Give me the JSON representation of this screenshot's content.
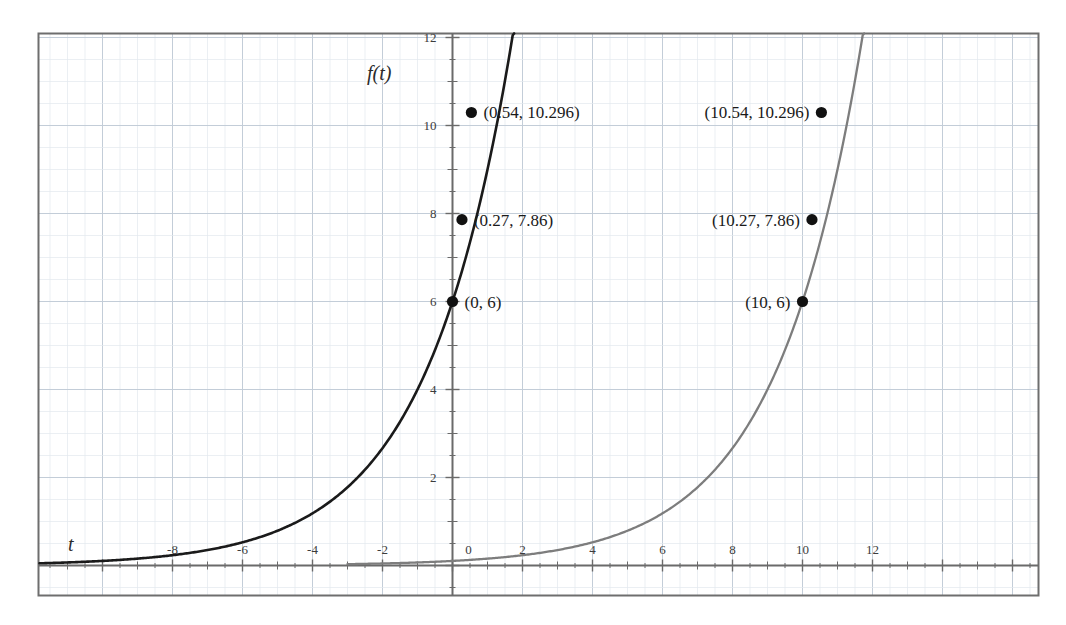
{
  "page": {
    "partial_heading": "Is once a.."
  },
  "chart_data": {
    "type": "line",
    "title": "",
    "xlabel": "t",
    "ylabel": "f(t)",
    "xlim": [
      -9.8,
      13.8
    ],
    "ylim": [
      -0.9,
      12.6
    ],
    "grid": true,
    "legend": false,
    "x_ticks": [
      -8,
      -6,
      -4,
      -2,
      0,
      2,
      4,
      6,
      8,
      10,
      12
    ],
    "x_tick_labels": [
      "-8",
      "-6",
      "-4",
      "-2",
      "0",
      "2",
      "4",
      "6",
      "8",
      "10",
      "12"
    ],
    "y_ticks": [
      2,
      4,
      6,
      8,
      10,
      12
    ],
    "y_tick_labels": [
      "2",
      "4",
      "6",
      "8",
      "10",
      "12"
    ],
    "origin_label": "0",
    "series": [
      {
        "name": "f(t) = 6(1.5)^t",
        "color": "#1a1a1a",
        "base": 1.5,
        "initial": 6,
        "shift": 0,
        "x": [
          -9.8,
          -9,
          -8,
          -7,
          -6,
          -5,
          -4,
          -3,
          -2,
          -1,
          0,
          0.27,
          0.54,
          0.8,
          1,
          1.2,
          1.4,
          1.6,
          1.71
        ],
        "y": [
          0.14,
          0.23,
          0.35,
          0.53,
          0.79,
          1.18,
          1.78,
          2.67,
          4.0,
          6.0,
          6.0,
          7.86,
          10.296,
          11.5,
          13.0,
          14.0,
          15.0,
          16.0,
          12.6
        ]
      },
      {
        "name": "f(t) = 6(1.5)^(t-10)",
        "color": "#7d7d7d",
        "base": 1.5,
        "initial": 6,
        "shift": 10,
        "x": [
          0.2,
          1,
          2,
          3,
          4,
          5,
          6,
          7,
          8,
          9,
          10,
          10.27,
          10.54,
          11,
          11.5,
          11.71
        ],
        "y": [
          0.14,
          0.23,
          0.35,
          0.53,
          0.79,
          1.18,
          1.78,
          2.67,
          4.0,
          6.0,
          6.0,
          7.86,
          10.296,
          12.0,
          14.0,
          12.6
        ]
      }
    ],
    "annotations": [
      {
        "id": "left-p1",
        "text": "(0.54, 10.296)",
        "x": 0.54,
        "y": 10.296,
        "anchor": "right-of-point"
      },
      {
        "id": "left-p2",
        "text": "(0.27, 7.86)",
        "x": 0.27,
        "y": 7.86,
        "anchor": "right-of-point"
      },
      {
        "id": "left-p3",
        "text": "(0, 6)",
        "x": 0,
        "y": 6,
        "anchor": "right-of-point"
      },
      {
        "id": "right-p1",
        "text": "(10.54, 10.296)",
        "x": 10.54,
        "y": 10.296,
        "anchor": "left-of-point"
      },
      {
        "id": "right-p2",
        "text": "(10.27, 7.86)",
        "x": 10.27,
        "y": 7.86,
        "anchor": "left-of-point"
      },
      {
        "id": "right-p3",
        "text": "(10, 6)",
        "x": 10,
        "y": 6,
        "anchor": "left-of-point"
      }
    ],
    "colors": {
      "frame": "#6e6e6e",
      "grid_major": "#c3cdd8",
      "grid_minor": "#e2e8ee",
      "axis": "#6a6a6a",
      "curve_primary": "#1a1a1a",
      "curve_secondary": "#7d7d7d",
      "point": "#111111",
      "background": "#ffffff"
    }
  },
  "labels": {
    "x_axis_name": "t",
    "y_axis_name": "f(t)",
    "tick_x_m8": "-8",
    "tick_x_m6": "-6",
    "tick_x_m4": "-4",
    "tick_x_m2": "-2",
    "tick_x_0": "0",
    "tick_x_2": "2",
    "tick_x_4": "4",
    "tick_x_6": "6",
    "tick_x_8": "8",
    "tick_x_10": "10",
    "tick_x_12": "12",
    "tick_y_2": "2",
    "tick_y_4": "4",
    "tick_y_6": "6",
    "tick_y_8": "8",
    "tick_y_10": "10",
    "tick_y_12": "12",
    "ann_left_1": "(0.54, 10.296)",
    "ann_left_2": "(0.27, 7.86)",
    "ann_left_3": "(0, 6)",
    "ann_right_1": "(10.54, 10.296)",
    "ann_right_2": "(10.27, 7.86)",
    "ann_right_3": "(10, 6)"
  }
}
